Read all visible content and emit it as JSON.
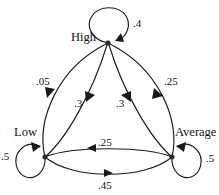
{
  "diagram": {
    "type": "markov-chain-state-transition-diagram",
    "nodes": [
      {
        "id": "high",
        "label": "High",
        "x": 108,
        "y": 43,
        "label_x": 71,
        "label_y": 31
      },
      {
        "id": "low",
        "label": "Low",
        "x": 45,
        "y": 157,
        "label_x": 14,
        "label_y": 126
      },
      {
        "id": "average",
        "label": "Average",
        "x": 172,
        "y": 157,
        "label_x": 175,
        "label_y": 126
      }
    ],
    "self_loops": [
      {
        "id": "high-self",
        "from": "high",
        "to": "high",
        "weight": ".4",
        "label_x": 133,
        "label_y": 18
      },
      {
        "id": "low-self",
        "from": "low",
        "to": "low",
        "weight": ".5",
        "label_x": 1,
        "label_y": 151
      },
      {
        "id": "average-self",
        "from": "average",
        "to": "average",
        "weight": ".5",
        "label_x": 206,
        "label_y": 153
      }
    ],
    "edges": [
      {
        "id": "low-to-high-outer",
        "from": "low",
        "to": "high",
        "weight": ".05",
        "label_x": 36,
        "label_y": 76
      },
      {
        "id": "low-to-high-inner",
        "from": "low",
        "to": "high",
        "weight": ".3",
        "label_x": 74,
        "label_y": 98
      },
      {
        "id": "average-to-high-inner",
        "from": "average",
        "to": "high",
        "weight": ".3",
        "label_x": 116,
        "label_y": 98
      },
      {
        "id": "high-to-average-outer",
        "from": "high",
        "to": "average",
        "weight": ".25",
        "label_x": 164,
        "label_y": 76
      },
      {
        "id": "average-to-low-bottom",
        "from": "average",
        "to": "low",
        "weight": ".25",
        "label_x": 98,
        "label_y": 137
      },
      {
        "id": "low-to-average-bottom",
        "from": "low",
        "to": "average",
        "weight": ".45",
        "label_x": 98,
        "label_y": 180
      }
    ],
    "colors": {
      "stroke": "#1a1a1a",
      "background": "#ffffff",
      "text": "#111111"
    }
  }
}
